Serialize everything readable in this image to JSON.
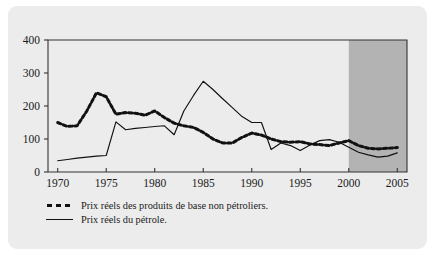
{
  "figure": {
    "panel_background": "#ececec",
    "forecast_shade_color": "#b3b3b3",
    "line_color": "#111111",
    "axis_color": "#333333"
  },
  "legend": {
    "position": "below-axis",
    "entries": [
      {
        "marker": "dashed",
        "label": "Prix réels des produits de base non pétroliers."
      },
      {
        "marker": "solid",
        "label": "Prix réels du pétrole."
      }
    ]
  },
  "chart_data": {
    "type": "line",
    "title": "",
    "subtitle": "",
    "xlabel": "",
    "ylabel": "",
    "xlim": [
      1969,
      2006
    ],
    "ylim": [
      0,
      400
    ],
    "grid": false,
    "legend_position": "below",
    "xticks": [
      1970,
      1975,
      1980,
      1985,
      1990,
      1995,
      2000,
      2005
    ],
    "xtick_labels": [
      "1970",
      "1975",
      "1980",
      "1985",
      "1990",
      "1995",
      "2000",
      "2005"
    ],
    "yticks": [
      0,
      100,
      200,
      300,
      400
    ],
    "ytick_labels": [
      "0",
      "100",
      "200",
      "300",
      "400"
    ],
    "annotations": [
      {
        "type": "shaded-region",
        "name": "forecast-region",
        "x_start": 2000,
        "x_end": 2006,
        "color": "#b3b3b3",
        "label": ""
      }
    ],
    "x": [
      1970,
      1971,
      1972,
      1973,
      1974,
      1975,
      1976,
      1977,
      1978,
      1979,
      1980,
      1981,
      1982,
      1983,
      1984,
      1985,
      1986,
      1987,
      1988,
      1989,
      1990,
      1991,
      1992,
      1993,
      1994,
      1995,
      1996,
      1997,
      1998,
      1999,
      2000,
      2001,
      2002,
      2003,
      2004,
      2005
    ],
    "series": [
      {
        "name": "Prix réels des produits de base non pétroliers.",
        "style": "dashed",
        "values": [
          150,
          138,
          140,
          185,
          240,
          228,
          175,
          180,
          178,
          172,
          185,
          165,
          148,
          140,
          135,
          120,
          100,
          88,
          88,
          105,
          118,
          112,
          100,
          92,
          90,
          92,
          85,
          83,
          80,
          88,
          95,
          80,
          72,
          70,
          72,
          74
        ]
      },
      {
        "name": "Prix réels du pétrole.",
        "style": "solid",
        "values": [
          34,
          38,
          42,
          45,
          48,
          50,
          152,
          128,
          132,
          135,
          138,
          140,
          113,
          185,
          232,
          275,
          250,
          222,
          195,
          168,
          150,
          150,
          68,
          88,
          80,
          65,
          82,
          95,
          98,
          90,
          75,
          60,
          52,
          45,
          48,
          58
        ]
      }
    ]
  }
}
